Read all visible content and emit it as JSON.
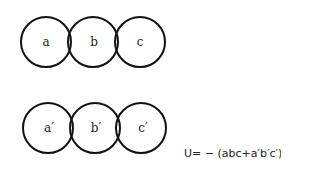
{
  "diagram": {
    "rows": [
      {
        "name": "top-row",
        "circles": [
          {
            "label": "a",
            "cx": 46,
            "cy": 42,
            "r": 25
          },
          {
            "label": "b",
            "cx": 93,
            "cy": 42,
            "r": 25
          },
          {
            "label": "c",
            "cx": 140,
            "cy": 42,
            "r": 25
          }
        ]
      },
      {
        "name": "bottom-row",
        "circles": [
          {
            "label": "a′",
            "cx": 48,
            "cy": 128,
            "r": 25
          },
          {
            "label": "b′",
            "cx": 95,
            "cy": 128,
            "r": 25
          },
          {
            "label": "c′",
            "cx": 141,
            "cy": 128,
            "r": 25
          }
        ]
      }
    ],
    "stroke_color": "#111111",
    "equation": "U= − (abc+a′b′c′)"
  }
}
